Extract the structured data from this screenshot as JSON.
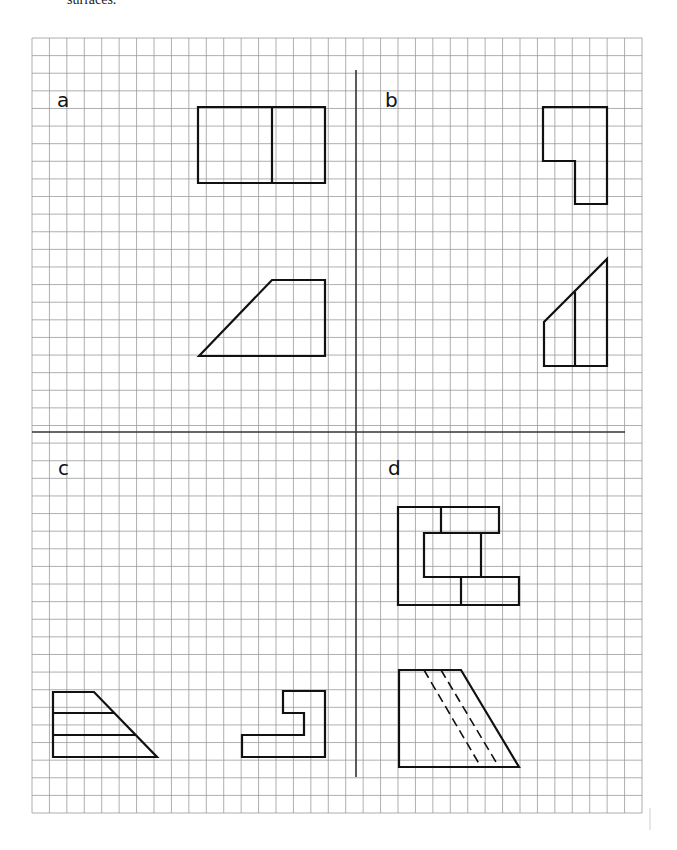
{
  "caption": "surfaces.",
  "grid": {
    "x0": 32,
    "y0": 38,
    "x1": 642,
    "y1": 813,
    "cols": 35,
    "rows": 44,
    "line_color": "#9a9a9a"
  },
  "dividers": {
    "vertical": {
      "x": 356,
      "y1": 70,
      "y2": 777
    },
    "horizontal": {
      "y": 432,
      "x1": 32,
      "x2": 625
    },
    "color": "#333333"
  },
  "panels": [
    {
      "id": "a",
      "label": "a",
      "label_pos": [
        57,
        107
      ]
    },
    {
      "id": "b",
      "label": "b",
      "label_pos": [
        385,
        107
      ]
    },
    {
      "id": "c",
      "label": "c",
      "label_pos": [
        58,
        475
      ]
    },
    {
      "id": "d",
      "label": "d",
      "label_pos": [
        388,
        475
      ]
    }
  ],
  "shapes": {
    "a_top": {
      "points": "198,107 325,107 325,183 198,183",
      "lines": [
        [
          272,
          107,
          272,
          183
        ]
      ]
    },
    "a_bottom": {
      "points": "199,356 272,280 325,280 325,356",
      "lines": []
    },
    "b_top": {
      "points": "543,107 607,107 607,204 575,204 575,161 543,161",
      "lines": []
    },
    "b_bottom": {
      "points": "544,366 544,322 607,259 607,366",
      "lines": [
        [
          575,
          292,
          575,
          366
        ]
      ]
    },
    "c_left": {
      "points": "53,692 94,692 157,757 53,757",
      "lines": [
        [
          53,
          713,
          114,
          713
        ],
        [
          53,
          735,
          136,
          735
        ]
      ]
    },
    "c_right": {
      "points": "283,691 325,691 325,757 242,757 242,735 304,735 304,713 283,713",
      "lines": []
    },
    "d_top": {
      "points": "398,507 499,507 499,533 424,533 424,577 519,577 519,605 398,605",
      "lines": [
        [
          441,
          507,
          441,
          533
        ],
        [
          481,
          533,
          481,
          577
        ],
        [
          461,
          577,
          461,
          605
        ]
      ]
    },
    "d_bottom": {
      "points": "399,670 461,670 519,767 399,767",
      "lines": [],
      "dashed": [
        [
          424,
          670,
          481,
          767
        ],
        [
          441,
          670,
          499,
          767
        ]
      ]
    }
  },
  "stroke_color": "#111111"
}
